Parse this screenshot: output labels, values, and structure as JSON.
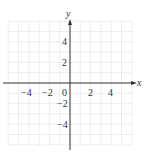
{
  "chart_data": {
    "type": "scatter",
    "title": "",
    "xlabel": "x",
    "ylabel": "y",
    "xlim": [
      -6,
      6
    ],
    "ylim": [
      -6,
      6
    ],
    "grid": true,
    "x_ticks": [
      "−4",
      "−2",
      "0",
      "2",
      "4"
    ],
    "y_ticks": [
      "4",
      "2",
      "−2",
      "−4"
    ],
    "series": []
  },
  "colors": {
    "grid": "#d8d8d8",
    "axis": "#333333"
  }
}
